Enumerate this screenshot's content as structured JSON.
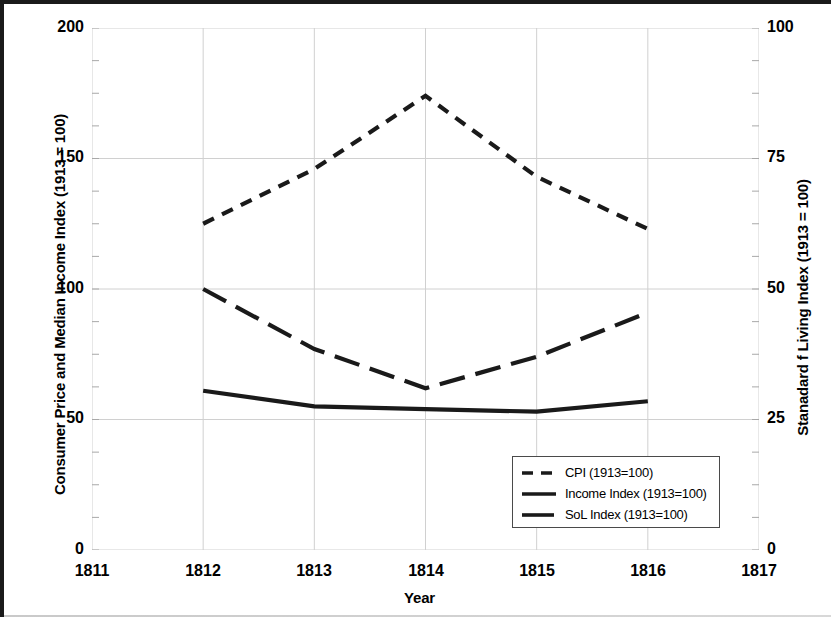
{
  "chart_data": {
    "type": "line",
    "title": "",
    "xlabel": "Year",
    "ylabel": "Consumer Price and Median Income Index (1913 = 100)",
    "y2label": "Stanadard f Living Index (1913 = 100)",
    "x": [
      1812,
      1813,
      1814,
      1815,
      1816
    ],
    "xlim": [
      1811,
      1817
    ],
    "ylim": [
      0,
      200
    ],
    "y2lim": [
      0,
      100
    ],
    "xticks": [
      "1811",
      "1812",
      "1813",
      "1814",
      "1815",
      "1816",
      "1817"
    ],
    "yticks": [
      "0",
      "50",
      "100",
      "150",
      "200"
    ],
    "y2ticks": [
      "0",
      "25",
      "50",
      "75",
      "100"
    ],
    "grid": true,
    "legend_position": "inside-lower-right",
    "series": [
      {
        "name": "CPI (1913=100)",
        "axis": "left",
        "style": "short-dashed",
        "color": "#1a1a1a",
        "values": [
          125,
          146,
          174,
          143,
          123
        ]
      },
      {
        "name": "Income Index (1913=100)",
        "axis": "left",
        "style": "long-dashed",
        "color": "#1a1a1a",
        "values": [
          100,
          77,
          62,
          74,
          91
        ]
      },
      {
        "name": "SoL Index (1913=100)",
        "axis": "right",
        "style": "solid",
        "color": "#1a1a1a",
        "values": [
          30.5,
          27.5,
          27,
          26.5,
          28.5
        ]
      }
    ]
  },
  "axes": {
    "y_left_title": "Consumer Price and Median Income Index (1913 = 100)",
    "y_right_title": "Stanadard f Living Index (1913 = 100)",
    "x_title": "Year",
    "y_left_ticks": [
      "200",
      "150",
      "100",
      "50",
      "0"
    ],
    "y_right_ticks": [
      "100",
      "75",
      "50",
      "25",
      "0"
    ],
    "x_ticks": [
      "1811",
      "1812",
      "1813",
      "1814",
      "1815",
      "1816",
      "1817"
    ]
  },
  "legend": {
    "items": [
      {
        "label": "CPI (1913=100)",
        "style": "short-dashed"
      },
      {
        "label": "Income Index (1913=100)",
        "style": "long-dashed"
      },
      {
        "label": "SoL Index (1913=100)",
        "style": "solid"
      }
    ]
  },
  "colors": {
    "line": "#1a1a1a",
    "grid": "#d0d0d0",
    "frame": "#1a1a1a",
    "legend_border": "#4a4a4a"
  }
}
